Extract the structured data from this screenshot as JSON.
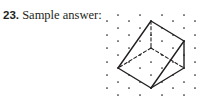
{
  "problem": {
    "number": "23.",
    "label": " Sample answer:"
  },
  "figure": {
    "dot_grid": {
      "odd_rows_y": [
        15,
        28,
        41,
        55,
        68,
        82,
        95
      ],
      "odd_rows_x": [
        118,
        140,
        162,
        184
      ],
      "even_rows_y": [
        21,
        35,
        48,
        62,
        75,
        88
      ],
      "even_rows_x": [
        107,
        129,
        151,
        173,
        195
      ],
      "dot_color": "#231f20"
    },
    "vertices": {
      "top": [
        151,
        21
      ],
      "right_upper": [
        184,
        41
      ],
      "right_lower": [
        184,
        68
      ],
      "bottom": [
        151,
        88
      ],
      "left": [
        118,
        68
      ],
      "hidden_center": [
        151,
        48
      ]
    },
    "solid_edges": [
      [
        "top",
        "right_upper"
      ],
      [
        "top",
        "left"
      ],
      [
        "right_upper",
        "right_lower"
      ],
      [
        "right_upper",
        "bottom"
      ],
      [
        "left",
        "bottom"
      ],
      [
        "bottom",
        "right_lower"
      ]
    ],
    "dashed_edges": [
      [
        "top",
        "hidden_center"
      ],
      [
        "hidden_center",
        "left"
      ],
      [
        "hidden_center",
        "right_lower"
      ]
    ],
    "line_color": "#231f20"
  }
}
